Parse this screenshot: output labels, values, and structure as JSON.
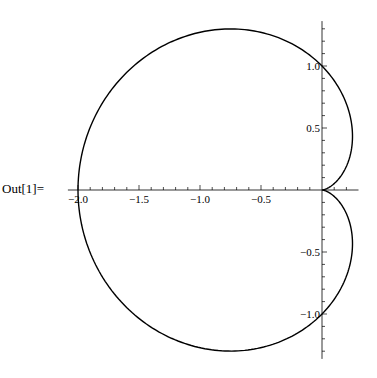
{
  "output_label": "Out[1]=",
  "chart_data": {
    "type": "line",
    "subtype": "polar-parametric",
    "title": "",
    "equation": "r = 1 - cos(theta)",
    "theta_range": [
      0,
      6.283185307
    ],
    "xlabel": "",
    "ylabel": "",
    "xlim": [
      -2.05,
      0.25
    ],
    "ylim": [
      -1.33,
      1.33
    ],
    "x_ticks": [
      -2.0,
      -1.5,
      -1.0,
      -0.5
    ],
    "x_tick_labels": [
      "-2.0",
      "-1.5",
      "-1.0",
      "-0.5"
    ],
    "y_ticks": [
      -1.0,
      -0.5,
      0.5,
      1.0
    ],
    "y_tick_labels": [
      "-1.0",
      "-0.5",
      "0.5",
      "1.0"
    ],
    "key_points": [
      {
        "x": -2.0,
        "y": 0.0
      },
      {
        "x": 0.0,
        "y": 1.0
      },
      {
        "x": 0.0,
        "y": -1.0
      },
      {
        "x": -0.75,
        "y": 1.299
      },
      {
        "x": -0.75,
        "y": -1.299
      },
      {
        "x": 0.0,
        "y": 0.0
      }
    ],
    "grid": false,
    "legend": null,
    "line_color": "#000000"
  }
}
